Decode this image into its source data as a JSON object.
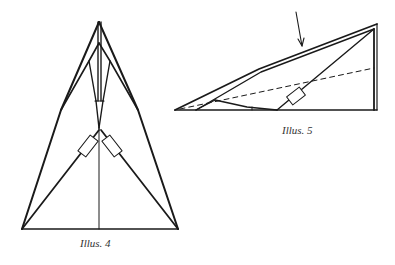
{
  "figures": [
    {
      "id": "illus-4",
      "caption": "Illus. 4",
      "subject": "folded paper airplane, top view",
      "line_color": "#1a1a1a"
    },
    {
      "id": "illus-5",
      "caption": "Illus. 5",
      "subject": "folded paper airplane, side view with fold arrow",
      "line_color": "#1a1a1a",
      "fold_line_style": "dashed"
    }
  ],
  "icons": {
    "fold_arrow": "down-arrow-icon"
  }
}
